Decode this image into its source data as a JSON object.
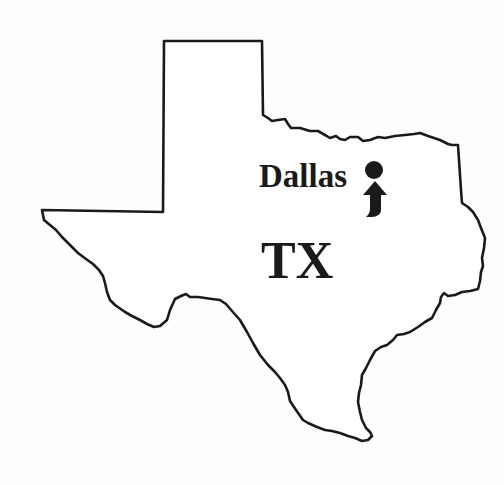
{
  "map": {
    "region": "Texas",
    "state_label": "TX",
    "city": {
      "name": "Dallas",
      "marker": "dot-icon",
      "pointer": "up-arrow-icon"
    },
    "colors": {
      "outline": "#1a1a1a",
      "fill": "#ffffff",
      "text": "#1a1a1a",
      "background": "#fdfdfd"
    }
  }
}
